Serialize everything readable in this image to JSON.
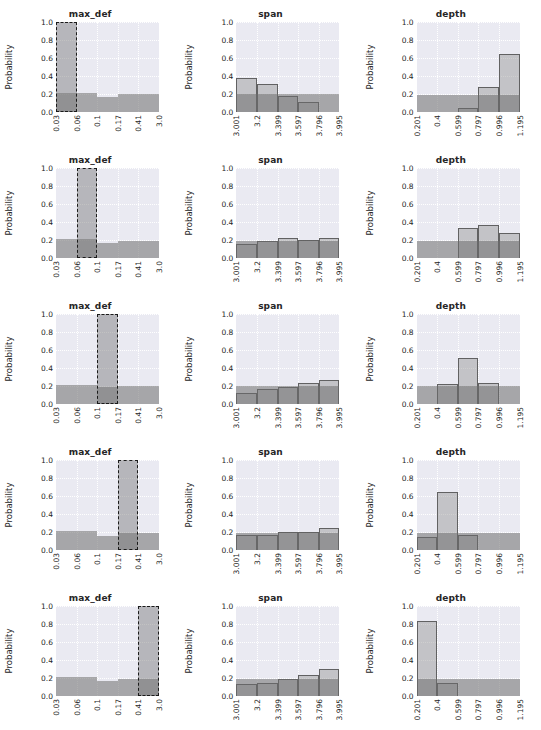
{
  "figure": {
    "rows": 5,
    "cols": 3,
    "ylabel": "Probability",
    "yticks": [
      "0.0",
      "0.2",
      "0.4",
      "0.6",
      "0.8",
      "1.0"
    ],
    "ylim": [
      0,
      1.0
    ],
    "background": "#eaeaf2",
    "bar_color": "#8c8c8c",
    "prior_color": "#6e6e6e",
    "highlight_edge": "#1a1a1a"
  },
  "columns": [
    {
      "name": "max_def",
      "title": "max_def",
      "xticks": [
        "0.03",
        "0.06",
        "0.1",
        "0.17",
        "0.41",
        "3.0"
      ]
    },
    {
      "name": "span",
      "title": "span",
      "xticks": [
        "3.001",
        "3.2",
        "3.399",
        "3.597",
        "3.796",
        "3.995"
      ]
    },
    {
      "name": "depth",
      "title": "depth",
      "xticks": [
        "0.201",
        "0.4",
        "0.599",
        "0.797",
        "0.996",
        "1.195"
      ]
    }
  ],
  "chart_data": [
    {
      "type": "bar",
      "row": 1,
      "panel": "max_def",
      "title": "max_def",
      "xlabel": "",
      "ylabel": "Probability",
      "ylim": [
        0,
        1.0
      ],
      "grid": true,
      "categories": [
        "0.03-0.06",
        "0.06-0.1",
        "0.1-0.17",
        "0.17-0.41",
        "0.41-3.0"
      ],
      "tick_labels": [
        "0.03",
        "0.06",
        "0.1",
        "0.17",
        "0.41",
        "3.0"
      ],
      "series": [
        {
          "name": "prior",
          "values": [
            0.21,
            0.21,
            0.17,
            0.2,
            0.2
          ]
        },
        {
          "name": "selected",
          "values": [
            1.0,
            0,
            0,
            0,
            0
          ]
        }
      ],
      "selected_bin": 0,
      "selected_value": 1.0
    },
    {
      "type": "bar",
      "row": 1,
      "panel": "span",
      "title": "span",
      "ylabel": "Probability",
      "ylim": [
        0,
        1.0
      ],
      "grid": true,
      "categories": [
        "3.001-3.2",
        "3.2-3.399",
        "3.399-3.597",
        "3.597-3.796",
        "3.796-3.995"
      ],
      "tick_labels": [
        "3.001",
        "3.2",
        "3.399",
        "3.597",
        "3.796",
        "3.995"
      ],
      "series": [
        {
          "name": "posterior",
          "values": [
            0.38,
            0.31,
            0.18,
            0.11,
            0.0
          ]
        },
        {
          "name": "prior",
          "values": [
            0.2,
            0.2,
            0.2,
            0.2,
            0.2
          ]
        }
      ]
    },
    {
      "type": "bar",
      "row": 1,
      "panel": "depth",
      "title": "depth",
      "ylabel": "Probability",
      "ylim": [
        0,
        1.0
      ],
      "grid": true,
      "categories": [
        "0.201-0.4",
        "0.4-0.599",
        "0.599-0.797",
        "0.797-0.996",
        "0.996-1.195"
      ],
      "tick_labels": [
        "0.201",
        "0.4",
        "0.599",
        "0.797",
        "0.996",
        "1.195"
      ],
      "series": [
        {
          "name": "posterior",
          "values": [
            0.0,
            0.0,
            0.05,
            0.28,
            0.64
          ]
        },
        {
          "name": "prior",
          "values": [
            0.19,
            0.19,
            0.19,
            0.19,
            0.19
          ]
        }
      ]
    },
    {
      "type": "bar",
      "row": 2,
      "panel": "max_def",
      "title": "max_def",
      "ylabel": "Probability",
      "ylim": [
        0,
        1.0
      ],
      "grid": true,
      "categories": [
        "0.03-0.06",
        "0.06-0.1",
        "0.1-0.17",
        "0.17-0.41",
        "0.41-3.0"
      ],
      "tick_labels": [
        "0.03",
        "0.06",
        "0.1",
        "0.17",
        "0.41",
        "3.0"
      ],
      "series": [
        {
          "name": "prior",
          "values": [
            0.21,
            0.21,
            0.17,
            0.19,
            0.19
          ]
        },
        {
          "name": "selected",
          "values": [
            0,
            1.0,
            0,
            0,
            0
          ]
        }
      ],
      "selected_bin": 1,
      "selected_value": 1.0
    },
    {
      "type": "bar",
      "row": 2,
      "panel": "span",
      "title": "span",
      "ylabel": "Probability",
      "ylim": [
        0,
        1.0
      ],
      "grid": true,
      "categories": [
        "3.001-3.2",
        "3.2-3.399",
        "3.399-3.597",
        "3.597-3.796",
        "3.796-3.995"
      ],
      "tick_labels": [
        "3.001",
        "3.2",
        "3.399",
        "3.597",
        "3.796",
        "3.995"
      ],
      "series": [
        {
          "name": "posterior",
          "values": [
            0.16,
            0.19,
            0.22,
            0.2,
            0.22
          ]
        },
        {
          "name": "prior",
          "values": [
            0.19,
            0.19,
            0.19,
            0.19,
            0.19
          ]
        }
      ]
    },
    {
      "type": "bar",
      "row": 2,
      "panel": "depth",
      "title": "depth",
      "ylabel": "Probability",
      "ylim": [
        0,
        1.0
      ],
      "grid": true,
      "categories": [
        "0.201-0.4",
        "0.4-0.599",
        "0.599-0.797",
        "0.797-0.996",
        "0.996-1.195"
      ],
      "tick_labels": [
        "0.201",
        "0.4",
        "0.599",
        "0.797",
        "0.996",
        "1.195"
      ],
      "series": [
        {
          "name": "posterior",
          "values": [
            0.0,
            0.0,
            0.33,
            0.37,
            0.28
          ]
        },
        {
          "name": "prior",
          "values": [
            0.19,
            0.19,
            0.19,
            0.19,
            0.19
          ]
        }
      ]
    },
    {
      "type": "bar",
      "row": 3,
      "panel": "max_def",
      "title": "max_def",
      "ylabel": "Probability",
      "ylim": [
        0,
        1.0
      ],
      "grid": true,
      "categories": [
        "0.03-0.06",
        "0.06-0.1",
        "0.1-0.17",
        "0.17-0.41",
        "0.41-3.0"
      ],
      "tick_labels": [
        "0.03",
        "0.06",
        "0.1",
        "0.17",
        "0.41",
        "3.0"
      ],
      "series": [
        {
          "name": "prior",
          "values": [
            0.21,
            0.21,
            0.19,
            0.2,
            0.2
          ]
        },
        {
          "name": "selected",
          "values": [
            0,
            0,
            1.0,
            0,
            0
          ]
        }
      ],
      "selected_bin": 2,
      "selected_value": 1.0
    },
    {
      "type": "bar",
      "row": 3,
      "panel": "span",
      "title": "span",
      "ylabel": "Probability",
      "ylim": [
        0,
        1.0
      ],
      "grid": true,
      "categories": [
        "3.001-3.2",
        "3.2-3.399",
        "3.399-3.597",
        "3.597-3.796",
        "3.796-3.995"
      ],
      "tick_labels": [
        "3.001",
        "3.2",
        "3.399",
        "3.597",
        "3.796",
        "3.995"
      ],
      "series": [
        {
          "name": "posterior",
          "values": [
            0.12,
            0.17,
            0.19,
            0.23,
            0.27
          ]
        },
        {
          "name": "prior",
          "values": [
            0.2,
            0.2,
            0.2,
            0.2,
            0.2
          ]
        }
      ]
    },
    {
      "type": "bar",
      "row": 3,
      "panel": "depth",
      "title": "depth",
      "ylabel": "Probability",
      "ylim": [
        0,
        1.0
      ],
      "grid": true,
      "categories": [
        "0.201-0.4",
        "0.4-0.599",
        "0.599-0.797",
        "0.797-0.996",
        "0.996-1.195"
      ],
      "tick_labels": [
        "0.201",
        "0.4",
        "0.599",
        "0.797",
        "0.996",
        "1.195"
      ],
      "series": [
        {
          "name": "posterior",
          "values": [
            0.0,
            0.22,
            0.51,
            0.23,
            0.0
          ]
        },
        {
          "name": "prior",
          "values": [
            0.2,
            0.2,
            0.2,
            0.2,
            0.2
          ]
        }
      ]
    },
    {
      "type": "bar",
      "row": 4,
      "panel": "max_def",
      "title": "max_def",
      "ylabel": "Probability",
      "ylim": [
        0,
        1.0
      ],
      "grid": true,
      "categories": [
        "0.03-0.06",
        "0.06-0.1",
        "0.1-0.17",
        "0.17-0.41",
        "0.41-3.0"
      ],
      "tick_labels": [
        "0.03",
        "0.06",
        "0.1",
        "0.17",
        "0.41",
        "3.0"
      ],
      "series": [
        {
          "name": "prior",
          "values": [
            0.21,
            0.21,
            0.16,
            0.19,
            0.19
          ]
        },
        {
          "name": "selected",
          "values": [
            0,
            0,
            0,
            1.0,
            0
          ]
        }
      ],
      "selected_bin": 3,
      "selected_value": 1.0
    },
    {
      "type": "bar",
      "row": 4,
      "panel": "span",
      "title": "span",
      "ylabel": "Probability",
      "ylim": [
        0,
        1.0
      ],
      "grid": true,
      "categories": [
        "3.001-3.2",
        "3.2-3.399",
        "3.399-3.597",
        "3.597-3.796",
        "3.796-3.995"
      ],
      "tick_labels": [
        "3.001",
        "3.2",
        "3.399",
        "3.597",
        "3.796",
        "3.995"
      ],
      "series": [
        {
          "name": "posterior",
          "values": [
            0.17,
            0.17,
            0.2,
            0.2,
            0.25
          ]
        },
        {
          "name": "prior",
          "values": [
            0.19,
            0.19,
            0.19,
            0.19,
            0.19
          ]
        }
      ]
    },
    {
      "type": "bar",
      "row": 4,
      "panel": "depth",
      "title": "depth",
      "ylabel": "Probability",
      "ylim": [
        0,
        1.0
      ],
      "grid": true,
      "categories": [
        "0.201-0.4",
        "0.4-0.599",
        "0.599-0.797",
        "0.797-0.996",
        "0.996-1.195"
      ],
      "tick_labels": [
        "0.201",
        "0.4",
        "0.599",
        "0.797",
        "0.996",
        "1.195"
      ],
      "series": [
        {
          "name": "posterior",
          "values": [
            0.15,
            0.65,
            0.17,
            0.0,
            0.0
          ]
        },
        {
          "name": "prior",
          "values": [
            0.19,
            0.19,
            0.19,
            0.19,
            0.19
          ]
        }
      ]
    },
    {
      "type": "bar",
      "row": 5,
      "panel": "max_def",
      "title": "max_def",
      "ylabel": "Probability",
      "ylim": [
        0,
        1.0
      ],
      "grid": true,
      "categories": [
        "0.03-0.06",
        "0.06-0.1",
        "0.1-0.17",
        "0.17-0.41",
        "0.41-3.0"
      ],
      "tick_labels": [
        "0.03",
        "0.06",
        "0.1",
        "0.17",
        "0.41",
        "3.0"
      ],
      "series": [
        {
          "name": "prior",
          "values": [
            0.21,
            0.21,
            0.17,
            0.19,
            0.19
          ]
        },
        {
          "name": "selected",
          "values": [
            0,
            0,
            0,
            0,
            1.0
          ]
        }
      ],
      "selected_bin": 4,
      "selected_value": 1.0
    },
    {
      "type": "bar",
      "row": 5,
      "panel": "span",
      "title": "span",
      "ylabel": "Probability",
      "ylim": [
        0,
        1.0
      ],
      "grid": true,
      "categories": [
        "3.001-3.2",
        "3.2-3.399",
        "3.399-3.597",
        "3.597-3.796",
        "3.796-3.995"
      ],
      "tick_labels": [
        "3.001",
        "3.2",
        "3.399",
        "3.597",
        "3.796",
        "3.995"
      ],
      "series": [
        {
          "name": "posterior",
          "values": [
            0.13,
            0.14,
            0.19,
            0.23,
            0.3
          ]
        },
        {
          "name": "prior",
          "values": [
            0.19,
            0.19,
            0.19,
            0.19,
            0.19
          ]
        }
      ]
    },
    {
      "type": "bar",
      "row": 5,
      "panel": "depth",
      "title": "depth",
      "ylabel": "Probability",
      "ylim": [
        0,
        1.0
      ],
      "grid": true,
      "categories": [
        "0.201-0.4",
        "0.4-0.599",
        "0.599-0.797",
        "0.797-0.996",
        "0.996-1.195"
      ],
      "tick_labels": [
        "0.201",
        "0.4",
        "0.599",
        "0.797",
        "0.996",
        "1.195"
      ],
      "series": [
        {
          "name": "posterior",
          "values": [
            0.83,
            0.14,
            0.0,
            0.0,
            0.0
          ]
        },
        {
          "name": "prior",
          "values": [
            0.19,
            0.19,
            0.19,
            0.19,
            0.19
          ]
        }
      ]
    }
  ]
}
